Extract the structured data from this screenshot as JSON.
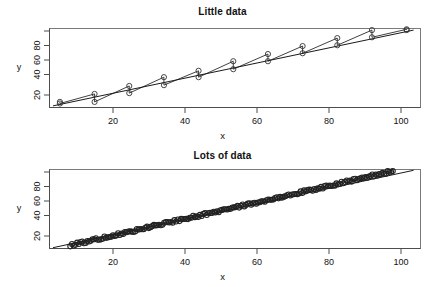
{
  "figure": {
    "kind": "two-panel-scatter-with-fit",
    "background": "#ffffff",
    "foreground": "#111111",
    "point_color": "#333333",
    "line_color": "#1a1a1a"
  },
  "panels": {
    "top": {
      "title": "Little data",
      "xlabel": "x",
      "ylabel": "y"
    },
    "bottom": {
      "title": "Lots of data",
      "xlabel": "x",
      "ylabel": "y"
    }
  },
  "chart_data": [
    {
      "type": "scatter",
      "title": "Little data",
      "xlabel": "x",
      "ylabel": "y",
      "grid": false,
      "legend": null,
      "xlim": [
        2,
        109
      ],
      "ylim": [
        2,
        101
      ],
      "xticks": [
        20,
        40,
        60,
        80,
        100
      ],
      "yticks": [
        20,
        40,
        60,
        80
      ],
      "series": [
        {
          "name": "observations",
          "marker": "open-circle",
          "x": [
            5,
            5,
            15,
            15,
            25,
            25,
            35,
            35,
            45,
            45,
            55,
            55,
            65,
            65,
            75,
            75,
            85,
            85,
            95,
            95,
            105,
            105
          ],
          "y": [
            9,
            7,
            19,
            9,
            29,
            20,
            40,
            30,
            48,
            40,
            60,
            50,
            69,
            60,
            79,
            70,
            89,
            80,
            99,
            90,
            100,
            99
          ]
        },
        {
          "name": "fitted-line",
          "marker": "none",
          "x": [
            3,
            107
          ],
          "y": [
            4,
            99
          ]
        }
      ]
    },
    {
      "type": "scatter",
      "title": "Lots of data",
      "xlabel": "x",
      "ylabel": "y",
      "grid": false,
      "legend": null,
      "xlim": [
        2,
        109
      ],
      "ylim": [
        2,
        101
      ],
      "xticks": [
        20,
        40,
        60,
        80,
        100
      ],
      "yticks": [
        20,
        40,
        60,
        80
      ],
      "series": [
        {
          "name": "observations",
          "marker": "open-circle",
          "n_points": 190,
          "x_range": [
            8,
            101
          ],
          "y_range": [
            6,
            99
          ],
          "description": "dense overlapping circles along a near-linear trend"
        },
        {
          "name": "fitted-line",
          "marker": "none",
          "x": [
            3,
            107
          ],
          "y": [
            3,
            100
          ]
        }
      ]
    }
  ],
  "axis_text": {
    "x_ticks_top": [
      "20",
      "40",
      "60",
      "80",
      "100"
    ],
    "x_ticks_bottom": [
      "20",
      "40",
      "60",
      "80",
      "100"
    ],
    "y_ticks": [
      "20",
      "40",
      "60",
      "80"
    ]
  }
}
